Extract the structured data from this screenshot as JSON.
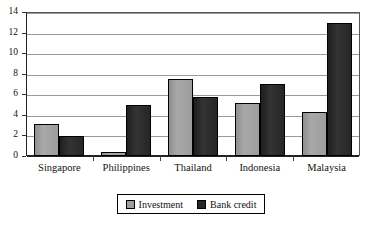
{
  "chart_data": {
    "type": "bar",
    "title": "",
    "title_clipped": true,
    "xlabel": "",
    "ylabel": "",
    "ylim": [
      0,
      14
    ],
    "ytick_step": 2,
    "yticks": [
      0,
      2,
      4,
      6,
      8,
      10,
      12,
      14
    ],
    "grid": true,
    "grid_axis": "y",
    "legend_position": "bottom-center",
    "legend_boxed": true,
    "categories": [
      "Singapore",
      "Philippines",
      "Thailand",
      "Indonesia",
      "Malaysia"
    ],
    "series": [
      {
        "name": "Investment",
        "color": "#9d9d9d",
        "values": [
          3.1,
          0.4,
          7.5,
          5.2,
          4.25
        ]
      },
      {
        "name": "Bank credit",
        "color": "#262626",
        "values": [
          1.9,
          5.0,
          5.75,
          7.0,
          12.9
        ]
      }
    ]
  },
  "axes": {
    "y_tick_labels": [
      "0",
      "2",
      "4",
      "6",
      "8",
      "10",
      "12",
      "14"
    ]
  },
  "legend": {
    "entries": [
      {
        "label": "Investment",
        "swatch": "investment-swatch"
      },
      {
        "label": "Bank credit",
        "swatch": "bank-credit-swatch"
      }
    ]
  }
}
